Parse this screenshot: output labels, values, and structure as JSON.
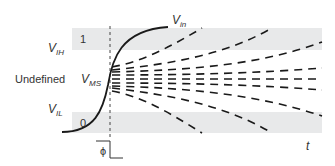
{
  "figure": {
    "colors": {
      "background": "#ffffff",
      "band": "#e8e9ea",
      "curve": "#1a1a1a",
      "text": "#333333"
    }
  },
  "labels": {
    "v_in": {
      "main": "V",
      "sub": "in"
    },
    "v_ih": {
      "main": "V",
      "sub": "IH"
    },
    "v_ms": {
      "main": "V",
      "sub": "MS"
    },
    "v_il": {
      "main": "V",
      "sub": "IL"
    },
    "undefined": "Undefined",
    "band_high": "1",
    "band_low": "0",
    "time_axis": "t",
    "clock_symbol": "ϕ"
  },
  "bands": [
    {
      "name": "logic-high-band",
      "label": "1",
      "y_top": 28,
      "y_bottom": 50
    },
    {
      "name": "logic-low-band",
      "label": "0",
      "y_top": 112,
      "y_bottom": 133
    }
  ],
  "trajectories": {
    "count_upper": 4,
    "count_lower": 4,
    "count_center": 1,
    "style": "dashed"
  }
}
